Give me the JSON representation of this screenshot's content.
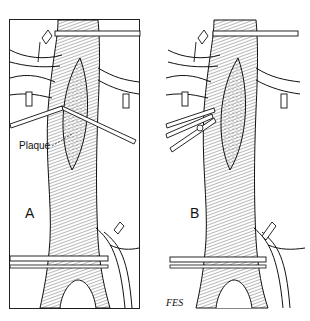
{
  "figure": {
    "panels": [
      {
        "id": "A",
        "label": "A",
        "annotation": "Plaque"
      },
      {
        "id": "B",
        "label": "B"
      }
    ],
    "signature": "FES",
    "colors": {
      "ink": "#111111",
      "background": "#ffffff",
      "shade": "#555555"
    }
  }
}
